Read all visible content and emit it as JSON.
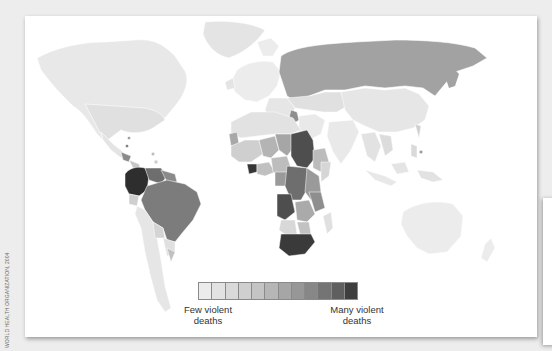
{
  "figure": {
    "credit": "World Health Organization, 2004",
    "legend": {
      "low_label_line1": "Few violent",
      "low_label_line2": "deaths",
      "high_label_line1": "Many violent",
      "high_label_line2": "deaths",
      "steps": 12,
      "colors": [
        "#ececec",
        "#e2e2e2",
        "#d9d9d9",
        "#cfcfcf",
        "#c4c4c4",
        "#b6b6b6",
        "#a6a6a6",
        "#979797",
        "#878787",
        "#747474",
        "#5f5f5f",
        "#3e3e3e"
      ]
    },
    "regions": {
      "very_high": [
        "Colombia",
        "South Africa",
        "Sudan (dark)",
        "Angola"
      ],
      "high": [
        "Brazil",
        "Venezuela",
        "Russia",
        "Côte d'Ivoire",
        "DR Congo",
        "Iraq"
      ],
      "moderate": [
        "West Africa",
        "Central Africa",
        "East Africa"
      ],
      "low": [
        "North America",
        "Europe",
        "China",
        "Australia",
        "South Asia",
        "Southern South America"
      ]
    }
  }
}
